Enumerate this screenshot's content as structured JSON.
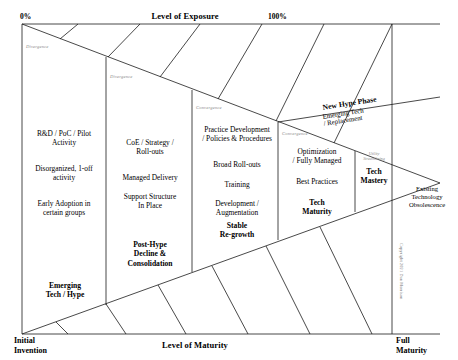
{
  "diagram": {
    "axes": {
      "top_title": "Level of Exposure",
      "top_left_value": "0%",
      "top_right_value": "100%",
      "bottom_title": "Level of Maturity",
      "bottom_left_label": "Initial\nInvention",
      "bottom_right_label": "Full\nMaturity"
    },
    "flow_labels": [
      {
        "text": "Divergence",
        "kind": "divergence"
      },
      {
        "text": "Divergence",
        "kind": "divergence"
      },
      {
        "text": "Convergence",
        "kind": "convergence"
      },
      {
        "text": "Convergence",
        "kind": "convergence"
      }
    ],
    "columns": [
      {
        "id": "column-1",
        "lines": [
          "R&D / PoC / Pilot\nActivity",
          "Disorganized, 1-off\nactivity",
          "Early Adoption in\ncertain groups"
        ],
        "summary": "Emerging\nTech / Hype"
      },
      {
        "id": "column-2",
        "lines": [
          "CoE / Strategy /\nRoll-outs",
          "Managed Delivery",
          "Support Structure\nIn Place"
        ],
        "summary": "Post-Hype\nDecline &\nConsolidation"
      },
      {
        "id": "column-3",
        "lines": [
          "Practice Development\n/ Policies & Procedures",
          "Broad Roll-outs",
          "Training",
          "Development /\nAugmentation"
        ],
        "summary": "Stable\nRe-growth"
      },
      {
        "id": "column-4",
        "lines": [
          "Optimization\n/ Fully Managed",
          "Best Practices"
        ],
        "summary": "Tech\nMaturity"
      },
      {
        "id": "column-5",
        "faint_label": "Utility\nStreamlining",
        "lines": [],
        "summary": "Tech\nMastery"
      }
    ],
    "annotations": {
      "new_hype_title": "New Hype Phase",
      "new_hype_subtitle": "Emerging Tech\n/ Replacement",
      "obsolescence": "Existing\nTechnology\nObsolescence",
      "copyright": "Copyright 2021 Dan Morrison"
    }
  }
}
